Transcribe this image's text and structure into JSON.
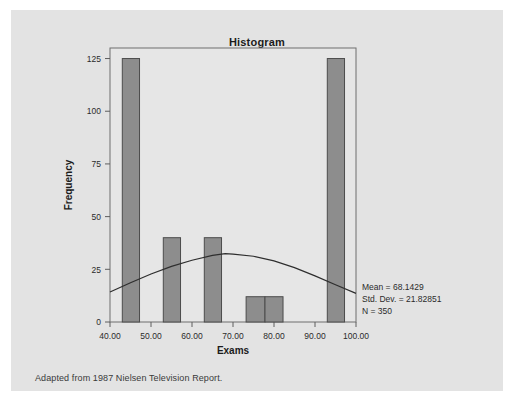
{
  "figure": {
    "title": "Histogram",
    "caption": "Adapted from 1987 Nielsen Television Report.",
    "panel_background": "#e3e3e3",
    "plot_background": "#e6e6e6",
    "bar_fill": "#8d8d8d",
    "bar_stroke": "#4c4c4c",
    "curve_color": "#2e2e2e"
  },
  "annotations": {
    "mean": "Mean = 68.1429",
    "std_dev": "Std. Dev. = 21.82851",
    "n": "N = 350"
  },
  "chart_data": {
    "type": "bar",
    "title": "Histogram",
    "xlabel": "Exams",
    "ylabel": "Frequency",
    "xlim": [
      40,
      100
    ],
    "ylim": [
      0,
      130
    ],
    "grid": false,
    "legend": null,
    "xticks": [
      40,
      50,
      60,
      70,
      80,
      90,
      100
    ],
    "xtick_labels": [
      "40.00",
      "50.00",
      "60.00",
      "70.00",
      "80.00",
      "90.00",
      "100.00"
    ],
    "yticks": [
      0,
      25,
      50,
      75,
      100,
      125
    ],
    "ytick_labels": [
      "0",
      "25",
      "50",
      "75",
      "100",
      "125"
    ],
    "bins": [
      {
        "x0": 43.0,
        "x1": 47.2,
        "value": 125
      },
      {
        "x0": 53.0,
        "x1": 57.2,
        "value": 40
      },
      {
        "x0": 63.0,
        "x1": 67.2,
        "value": 40
      },
      {
        "x0": 73.2,
        "x1": 77.8,
        "value": 12
      },
      {
        "x0": 77.8,
        "x1": 82.2,
        "value": 12
      },
      {
        "x0": 93.0,
        "x1": 97.2,
        "value": 125
      }
    ],
    "overlay": {
      "type": "normal-curve",
      "mean": 68.1429,
      "std_dev": 21.82851,
      "n": 350,
      "peak_value": 32.4,
      "points": [
        {
          "x": 40,
          "y": 14.2
        },
        {
          "x": 45,
          "y": 18.6
        },
        {
          "x": 50,
          "y": 22.8
        },
        {
          "x": 55,
          "y": 26.4
        },
        {
          "x": 60,
          "y": 29.3
        },
        {
          "x": 65,
          "y": 31.6
        },
        {
          "x": 68.1,
          "y": 32.4
        },
        {
          "x": 70,
          "y": 32.2
        },
        {
          "x": 75,
          "y": 31.2
        },
        {
          "x": 80,
          "y": 29.0
        },
        {
          "x": 85,
          "y": 25.8
        },
        {
          "x": 90,
          "y": 21.9
        },
        {
          "x": 95,
          "y": 17.7
        },
        {
          "x": 100,
          "y": 13.6
        }
      ]
    }
  }
}
